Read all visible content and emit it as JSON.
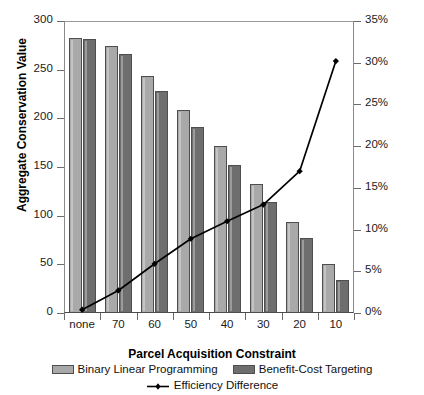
{
  "chart_data": {
    "type": "bar",
    "title": "",
    "xlabel": "Parcel Acquisition Constraint",
    "ylabel": "Aggregate Conservation Value",
    "y2label": "Efficiency Difference",
    "categories": [
      "none",
      "70",
      "60",
      "50",
      "40",
      "30",
      "20",
      "10"
    ],
    "ylim": [
      0,
      300
    ],
    "y2lim": [
      0,
      35
    ],
    "yticks": [
      "0",
      "50",
      "100",
      "150",
      "200",
      "250",
      "300"
    ],
    "ytick_values": [
      0,
      50,
      100,
      150,
      200,
      250,
      300
    ],
    "y2ticks": [
      "0%",
      "5%",
      "10%",
      "15%",
      "20%",
      "25%",
      "30%",
      "35%"
    ],
    "y2tick_values": [
      0,
      5,
      10,
      15,
      20,
      25,
      30,
      35
    ],
    "grid": false,
    "legend_position": "bottom",
    "series": [
      {
        "name": "Binary Linear Programming",
        "kind": "bar",
        "axis": "left",
        "color": "#a9a9a9",
        "values": [
          283,
          274,
          243,
          209,
          172,
          133,
          93,
          50
        ]
      },
      {
        "name": "Benefit-Cost Targeting",
        "kind": "bar",
        "axis": "left",
        "color": "#6e6e6e",
        "values": [
          282,
          266,
          228,
          191,
          152,
          114,
          77,
          34
        ]
      },
      {
        "name": "Efficiency Difference",
        "kind": "line",
        "axis": "right",
        "color": "#000000",
        "values": [
          0.4,
          2.7,
          5.9,
          8.9,
          11.0,
          13.0,
          17.0,
          30.2
        ]
      }
    ]
  },
  "legend": {
    "items": [
      {
        "label": "Binary Linear Programming",
        "marker": "bar-swatch-light"
      },
      {
        "label": "Benefit-Cost Targeting",
        "marker": "bar-swatch-dark"
      },
      {
        "label": "Efficiency Difference",
        "marker": "line-marker"
      }
    ]
  }
}
